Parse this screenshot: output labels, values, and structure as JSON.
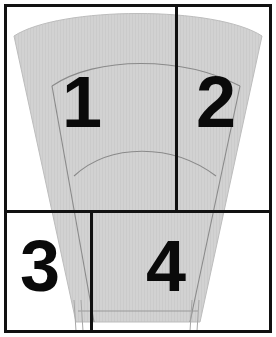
{
  "figure": {
    "canvas": {
      "width": 276,
      "height": 337
    },
    "background_color": "#ffffff",
    "frame_color": "#111111",
    "region_fill_color": "#d2d2d2",
    "region_outline_color": "#8a8a8a",
    "divider_color": "#111111"
  },
  "quadrants": [
    {
      "id": "quadrant-1",
      "label": "1"
    },
    {
      "id": "quadrant-2",
      "label": "2"
    },
    {
      "id": "quadrant-3",
      "label": "3"
    },
    {
      "id": "quadrant-4",
      "label": "4"
    }
  ],
  "dividers": {
    "vertical_top_x": 176,
    "horizontal_y": 211,
    "vertical_bottom_x": 91
  }
}
